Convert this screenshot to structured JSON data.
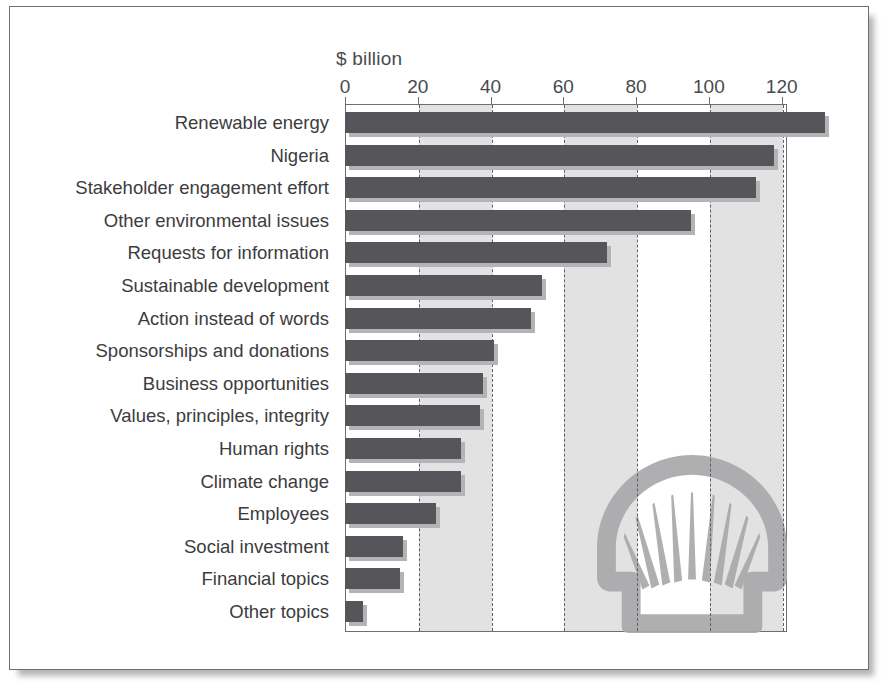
{
  "chart_data": {
    "type": "bar",
    "orientation": "horizontal",
    "title": "",
    "xlabel": "$ billion",
    "ylabel": "",
    "xlim": [
      0,
      132
    ],
    "xticks": [
      0,
      20,
      40,
      60,
      80,
      100,
      120
    ],
    "xtick_labels": [
      "0",
      "20",
      "40",
      "60",
      "80",
      "100",
      "120"
    ],
    "grid": true,
    "grid_style": "dashed vertical",
    "legend": null,
    "categories": [
      "Renewable energy",
      "Nigeria",
      "Stakeholder engagement effort",
      "Other environmental issues",
      "Requests for information",
      "Sustainable development",
      "Action instead of words",
      "Sponsorships and donations",
      "Business opportunities",
      "Values, principles, integrity",
      "Human rights",
      "Climate change",
      "Employees",
      "Social investment",
      "Financial topics",
      "Other topics"
    ],
    "values": [
      132,
      118,
      113,
      95,
      72,
      54,
      51,
      41,
      38,
      37,
      32,
      32,
      25,
      16,
      15,
      5
    ],
    "watermark": "shell-pecten-logo"
  },
  "colors": {
    "bar": "#56565a",
    "bar_shadow": "#b4b4b6",
    "band": "#e2e2e2",
    "gridline": "#5f5f61",
    "frame": "#6e6e70",
    "text": "#3c3c3e",
    "watermark": "#a9a9ab",
    "background": "#ffffff"
  }
}
